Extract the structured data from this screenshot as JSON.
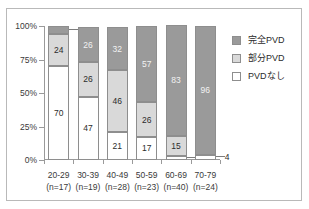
{
  "chart_data": {
    "type": "bar",
    "subtype": "100% stacked column",
    "title": "",
    "xlabel": "",
    "ylabel": "",
    "ylim": [
      0,
      100
    ],
    "yticks": [
      "0%",
      "25%",
      "50%",
      "75%",
      "100%"
    ],
    "ytick_values": [
      0,
      25,
      50,
      75,
      100
    ],
    "grid": false,
    "legend_position": "right",
    "categories": [
      "20-29",
      "30-39",
      "40-49",
      "50-59",
      "60-69",
      "70-79"
    ],
    "category_counts": [
      "(n=17)",
      "(n=19)",
      "(n=28)",
      "(n=23)",
      "(n=40)",
      "(n=24)"
    ],
    "series": [
      {
        "name": "完全PVD",
        "key": "full",
        "color": "#9a9a9a",
        "values": [
          6,
          26,
          32,
          57,
          83,
          96
        ]
      },
      {
        "name": "部分PVD",
        "key": "partial",
        "color": "#d9d9d9",
        "values": [
          24,
          26,
          46,
          26,
          15,
          0
        ]
      },
      {
        "name": "PVDなし",
        "key": "none",
        "color": "#ffffff",
        "values": [
          70,
          47,
          21,
          17,
          3,
          4
        ]
      }
    ]
  },
  "legend": {
    "items": [
      {
        "label": "完全PVD",
        "swatch": "full"
      },
      {
        "label": "部分PVD",
        "swatch": "partial"
      },
      {
        "label": "PVDなし",
        "swatch": "none"
      }
    ]
  },
  "axis": {
    "y_labels": [
      "100%",
      "75%",
      "50%",
      "25%",
      "0%"
    ]
  }
}
